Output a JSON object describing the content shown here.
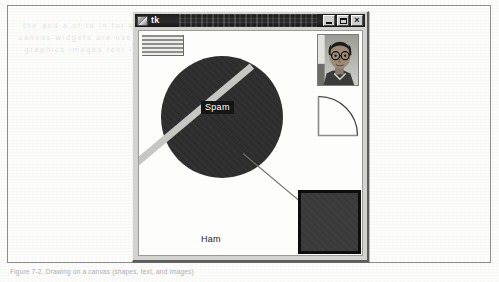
{
  "page": {
    "caption": "Figure 7-2. Drawing on a canvas (shapes, text, and images)",
    "ghost_lines": [
      "the  and  a  of  to  in  for  with",
      "canvas  widgets  are  used  draw",
      "graphics  images  text  items  on"
    ]
  },
  "window": {
    "title": "tk",
    "icon": "tk-logo-icon",
    "controls": [
      {
        "name": "minimize-button",
        "glyph": "_"
      },
      {
        "name": "maximize-button",
        "glyph": "□"
      },
      {
        "name": "close-button",
        "glyph": "×"
      }
    ]
  },
  "canvas": {
    "name": "tk-canvas",
    "items": {
      "striped_list": {
        "label": "striped-list-widget"
      },
      "circle": {
        "label": "spam-oval",
        "fill": "#2d2d2d"
      },
      "spam_text": {
        "text": "Spam",
        "fg": "#ffffff",
        "bg": "#161616"
      },
      "ham_text": {
        "text": "Ham",
        "fg": "#262626"
      },
      "thick_line": {
        "label": "thick-diagonal-line",
        "color": "#c6c6c2"
      },
      "thin_line": {
        "label": "thin-diagonal-line",
        "color": "#6e6e6a"
      },
      "photo": {
        "label": "photo-thumbnail"
      },
      "arc": {
        "label": "quarter-arc-shape"
      },
      "square": {
        "label": "filled-rectangle",
        "fill": "#3a3a3a",
        "border": "#0d0d0d"
      }
    }
  }
}
